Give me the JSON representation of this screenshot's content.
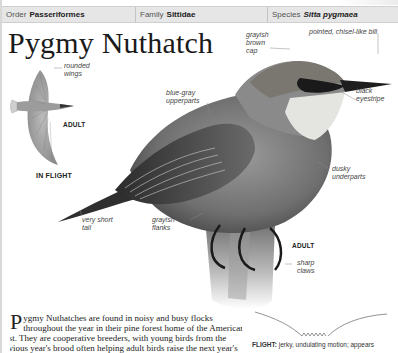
{
  "taxonomy": {
    "order": {
      "key": "Order",
      "value": "Passeriformes"
    },
    "family": {
      "key": "Family",
      "value": "Sittidae"
    },
    "species": {
      "key": "Species",
      "value": "Sitta pygmaea"
    }
  },
  "title": "Pygmy Nuthatch",
  "inset": {
    "annotation": "rounded wings",
    "annotation_lines": [
      "rounded",
      "wings"
    ],
    "age_tag": "ADULT",
    "caption": "IN FLIGHT"
  },
  "annotations": {
    "cap": [
      "grayish",
      "brown",
      "cap"
    ],
    "bill": "pointed, chisel-like bill",
    "eyestripe": [
      "black",
      "eyestripe"
    ],
    "upperparts": [
      "blue-gray",
      "upperparts"
    ],
    "underparts": [
      "dusky",
      "underparts"
    ],
    "tail": [
      "very short",
      "tail"
    ],
    "flanks": [
      "grayish",
      "flanks"
    ],
    "claws": [
      "sharp",
      "claws"
    ],
    "main_age_tag": "ADULT"
  },
  "body_text": {
    "dropcap": "P",
    "lines": [
      "ygmy Nuthatches are found in noisy and busy flocks",
      "throughout the year in their pine forest home of the American",
      "West. They are cooperative breeders, with young birds from the",
      "previous year's brood often helping adult birds raise the next year's"
    ]
  },
  "flight": {
    "label": "FLIGHT:",
    "text": " jerky, undulating motion; appears"
  },
  "colors": {
    "header_bg": "#e6e6e6",
    "text": "#222222",
    "leader": "#888888"
  }
}
